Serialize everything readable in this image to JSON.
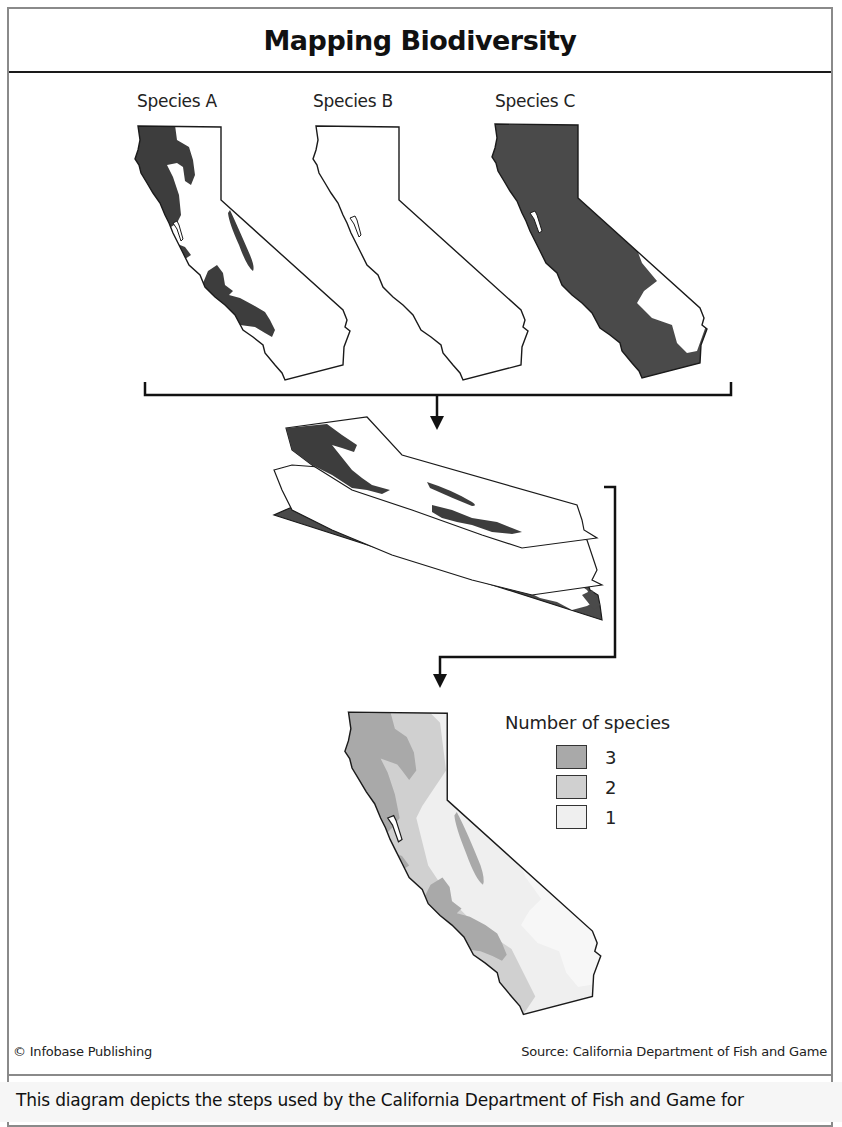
{
  "header": {
    "title": "Mapping Biodiversity"
  },
  "species_maps": [
    {
      "label": "Species A",
      "fill": "#3d3d3d",
      "description": "Dark range along north coast, bay area, central coast ranges and a narrow strip inland"
    },
    {
      "label": "Species B",
      "fill": "#ffffff",
      "description": "Outline only, no shaded range"
    },
    {
      "label": "Species C",
      "fill": "#4a4a4a",
      "description": "Almost entire state shaded except southeastern desert"
    }
  ],
  "stack": {
    "description": "Three maps overlaid as stacked layers",
    "layer_order": [
      "Species A",
      "Species B",
      "Species C"
    ]
  },
  "result_map": {
    "description": "Combined map showing number of species per area"
  },
  "legend": {
    "title": "Number of species",
    "items": [
      {
        "value": "3",
        "color": "#a9a9a9"
      },
      {
        "value": "2",
        "color": "#d0d0d0"
      },
      {
        "value": "1",
        "color": "#efefef"
      }
    ]
  },
  "footer": {
    "credit": "© Infobase Publishing",
    "source": "Source: California Department of Fish and Game"
  },
  "caption": {
    "text": "This diagram depicts the steps used by the California Department of Fish and Game for"
  },
  "colors": {
    "frame": "#8a8a8a",
    "arrow": "#111111",
    "outline": "#1a1a1a"
  }
}
